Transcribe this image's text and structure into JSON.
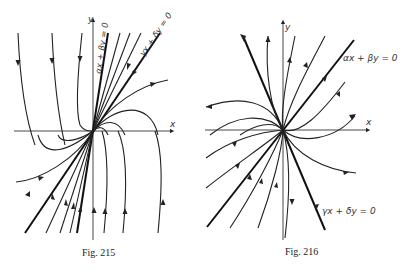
{
  "figures": [
    {
      "id": "fig215",
      "caption": "Fig. 215",
      "axis_labels": {
        "x": "x",
        "y": "y"
      },
      "line_labels": [
        "αx + βy = 0",
        "γx + δy = 0"
      ],
      "description": "Improper node: trajectories tangent to a line at origin, flowing in from top, out to bottom (directions as shown)."
    },
    {
      "id": "fig216",
      "caption": "Fig. 216",
      "axis_labels": {
        "x": "x",
        "y": "y"
      },
      "line_labels": [
        "αx + βy = 0",
        "γx + δy = 0"
      ],
      "description": "Node: trajectories emanating from origin, tangent to two lines."
    }
  ]
}
